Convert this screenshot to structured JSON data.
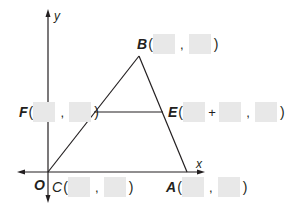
{
  "diagram": {
    "axes": {
      "x_label": "x",
      "y_label": "y",
      "origin_label": "O"
    },
    "points": [
      {
        "name": "B",
        "label": "B",
        "coords": [
          "",
          ""
        ],
        "separator": ","
      },
      {
        "name": "F",
        "label": "F",
        "coords": [
          "",
          ""
        ],
        "separator": ","
      },
      {
        "name": "E",
        "label": "E",
        "coords": [
          "",
          "",
          ""
        ],
        "separators": [
          "+",
          ","
        ]
      },
      {
        "name": "C",
        "label": "C",
        "coords": [
          "",
          ""
        ],
        "separator": ","
      },
      {
        "name": "A",
        "label": "A",
        "coords": [
          "",
          ""
        ],
        "separator": ","
      }
    ],
    "punctuation": {
      "open": "(",
      "close": ")",
      "comma": ",",
      "plus": "+"
    },
    "segments": [
      {
        "from": "O",
        "to": "B"
      },
      {
        "from": "B",
        "to": "A"
      },
      {
        "from": "F",
        "to": "E",
        "note": "horizontal midsegment"
      }
    ],
    "colors": {
      "line": "#231f20",
      "placeholder": "#e8e8e8",
      "background": "#ffffff"
    }
  }
}
